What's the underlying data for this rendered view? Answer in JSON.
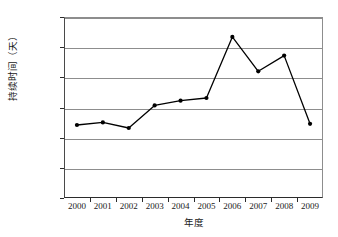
{
  "chart_data": {
    "type": "line",
    "title": "",
    "xlabel": "年度",
    "ylabel": "持续时间（天）",
    "categories": [
      "2000",
      "2001",
      "2002",
      "2003",
      "2004",
      "2005",
      "2006",
      "2007",
      "2008",
      "2009"
    ],
    "values": [
      484,
      501,
      464,
      614,
      645,
      663,
      1068,
      840,
      944,
      492
    ],
    "series": [
      {
        "name": "持续时间",
        "values": [
          484,
          501,
          464,
          614,
          645,
          663,
          1068,
          840,
          944,
          492
        ]
      }
    ],
    "ylim": [
      0,
      1200
    ],
    "ytick_values": [
      0,
      200,
      400,
      600,
      800,
      1000,
      1200
    ],
    "ytick_labels": [
      "0",
      "200",
      "400",
      "600",
      "800",
      "1 000",
      "1 200"
    ],
    "xtick_labels": [
      "2000",
      "2001",
      "2002",
      "2003",
      "2004",
      "2005",
      "2006",
      "2007",
      "2008",
      "2009"
    ],
    "grid": true,
    "grid_axis": "y",
    "legend": false,
    "legend_position": "none",
    "marker": "filled-circle",
    "line_color": "#000000",
    "marker_color": "#000000",
    "grid_color": "#8d8d8d",
    "axis_color": "#2b2b2b",
    "background_color": "#ffffff"
  }
}
